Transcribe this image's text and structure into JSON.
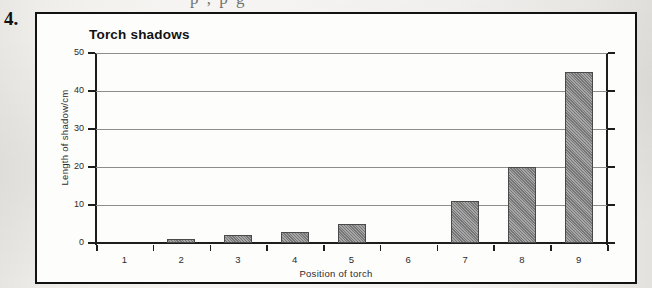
{
  "question_number": "4.",
  "top_cut_text": "p       ,    p       g",
  "chart_data": {
    "type": "bar",
    "title": "Torch shadows",
    "xlabel": "Position of torch",
    "ylabel": "Length of shadow/cm",
    "categories": [
      "1",
      "2",
      "3",
      "4",
      "5",
      "6",
      "7",
      "8",
      "9"
    ],
    "values": [
      0,
      1,
      2,
      3,
      5,
      0,
      11,
      20,
      45
    ],
    "ylim": [
      0,
      50
    ],
    "yticks": [
      0,
      10,
      20,
      30,
      40,
      50
    ],
    "grid": true,
    "legend": "none",
    "bar_color": "#7f7f7f",
    "bar_edge_color": "#4a4a4a",
    "axis_color": "#1d1d1d",
    "gridline_color": "#8d8d8d"
  }
}
